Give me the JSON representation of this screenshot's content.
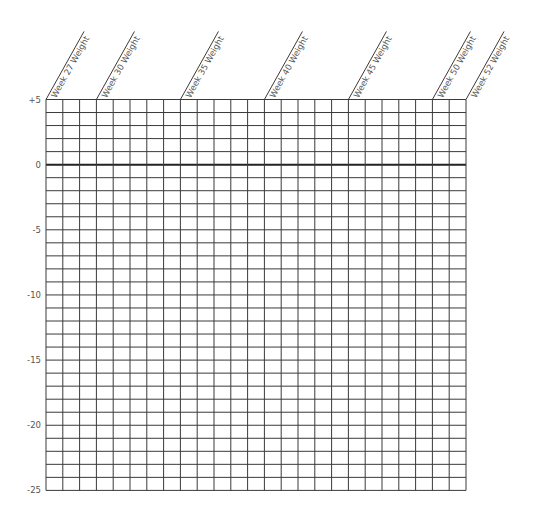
{
  "chart_data": {
    "type": "table",
    "title": "",
    "xlabel": "",
    "ylabel": "",
    "columns": 25,
    "rows": 30,
    "ylim": [
      -25,
      5
    ],
    "y_step_per_row": 1,
    "y_ticks": [
      {
        "value": 5,
        "label": "+5"
      },
      {
        "value": 0,
        "label": "0"
      },
      {
        "value": -5,
        "label": "-5"
      },
      {
        "value": -10,
        "label": "-10"
      },
      {
        "value": -15,
        "label": "-15"
      },
      {
        "value": -20,
        "label": "-20"
      },
      {
        "value": -25,
        "label": "-25"
      }
    ],
    "column_headers": [
      {
        "week": 27,
        "label": "Week 27 Weight",
        "col_index": 0
      },
      {
        "week": 30,
        "label": "Week 30 Weight",
        "col_index": 3
      },
      {
        "week": 35,
        "label": "Week 35 Weight",
        "col_index": 8
      },
      {
        "week": 40,
        "label": "Week 40 Weight",
        "col_index": 13
      },
      {
        "week": 45,
        "label": "Week 45 Weight",
        "col_index": 18
      },
      {
        "week": 50,
        "label": "Week 50 Weight",
        "col_index": 23
      },
      {
        "week": 52,
        "label": "Week 52 Weight",
        "col_index": 25
      }
    ],
    "emphasized_line": 0,
    "grid": true,
    "legend": null,
    "series": []
  },
  "layout": {
    "grid_left": 46,
    "grid_top": 99.5,
    "col_width": 16.8,
    "row_height": 13.03,
    "label_angle_deg": -60.8,
    "diag_length": 78
  }
}
